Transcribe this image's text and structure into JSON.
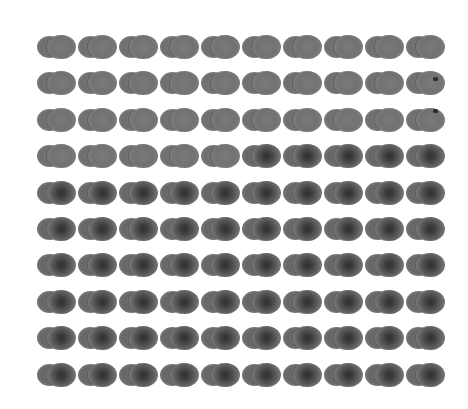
{
  "grid": {
    "rows": 10,
    "cols": 10,
    "origin_x": 37,
    "origin_y": 35,
    "col_spacing": 41,
    "row_spacing": 36.4,
    "background_color": "#ffffff",
    "glyph": "two-overlapping-circles",
    "cell_states": [
      [
        "light",
        "light",
        "light",
        "light",
        "light",
        "light",
        "light",
        "light",
        "light",
        "light"
      ],
      [
        "light",
        "light",
        "light",
        "light",
        "light",
        "light",
        "light",
        "light",
        "light",
        "light"
      ],
      [
        "light",
        "light",
        "light",
        "light",
        "light",
        "light",
        "light",
        "light",
        "light",
        "light"
      ],
      [
        "light",
        "light",
        "light",
        "light",
        "light",
        "dark",
        "dark",
        "dark",
        "dark",
        "dark"
      ],
      [
        "dark",
        "dark",
        "dark",
        "dark",
        "dark",
        "dark",
        "dark",
        "dark",
        "dark",
        "dark"
      ],
      [
        "dark",
        "dark",
        "dark",
        "dark",
        "dark",
        "dark",
        "dark",
        "dark",
        "dark",
        "dark"
      ],
      [
        "dark",
        "dark",
        "dark",
        "dark",
        "dark",
        "dark",
        "dark",
        "dark",
        "dark",
        "dark"
      ],
      [
        "dark",
        "dark",
        "dark",
        "dark",
        "dark",
        "dark",
        "dark",
        "dark",
        "dark",
        "dark"
      ],
      [
        "dark",
        "dark",
        "dark",
        "dark",
        "dark",
        "dark",
        "dark",
        "dark",
        "dark",
        "dark"
      ],
      [
        "dark",
        "dark",
        "dark",
        "dark",
        "dark",
        "dark",
        "dark",
        "dark",
        "dark",
        "dark"
      ]
    ],
    "marks": [
      {
        "row": 1,
        "col": 9
      },
      {
        "row": 2,
        "col": 9
      }
    ]
  }
}
